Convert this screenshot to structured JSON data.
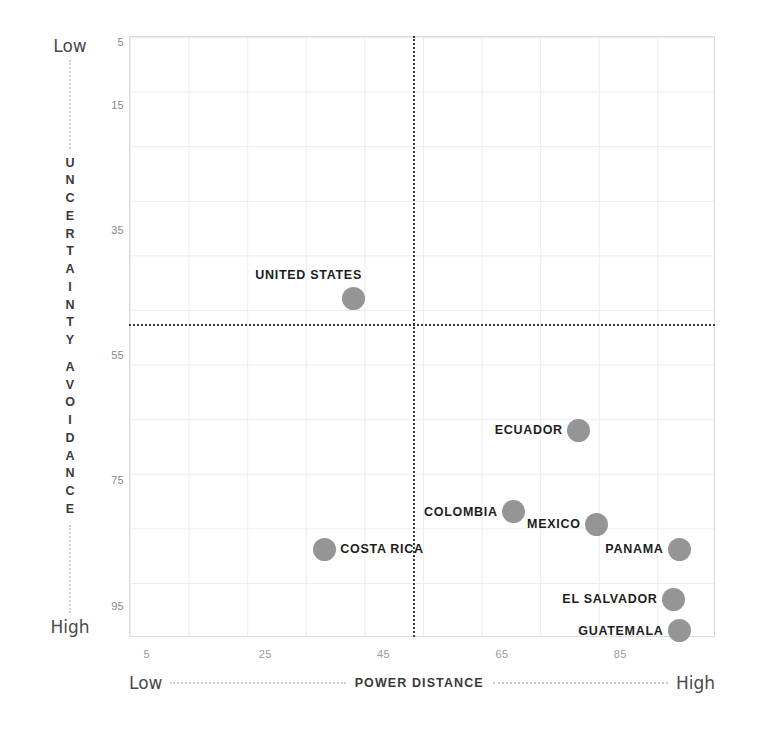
{
  "chart_data": {
    "type": "scatter",
    "title": "",
    "xlabel": "POWER DISTANCE",
    "ylabel": "UNCERTAINTY AVOIDANCE",
    "x_low_label": "Low",
    "x_high_label": "High",
    "y_low_label": "Low",
    "y_high_label": "High",
    "xticks": [
      5,
      25,
      45,
      65,
      85
    ],
    "xtick_labels": [
      "5",
      "25",
      "45",
      "65",
      "85"
    ],
    "yticks": [
      5,
      15,
      35,
      55,
      75,
      95
    ],
    "ytick_labels": [
      "5",
      "15",
      "35",
      "55",
      "75",
      "95"
    ],
    "xlim": [
      2,
      101
    ],
    "ylim": [
      4,
      100
    ],
    "y_inverted": true,
    "grid": true,
    "legend": "none",
    "quadrant_divider_x": 50,
    "quadrant_divider_y": 50,
    "point_color": "#8c8c8c",
    "grid_color": "#ececec",
    "divider_color": "#3b3b3b",
    "points": [
      {
        "name": "UNITED STATES",
        "x": 40,
        "y": 46,
        "label_side": "left"
      },
      {
        "name": "ECUADOR",
        "x": 78,
        "y": 67,
        "label_side": "left"
      },
      {
        "name": "COLOMBIA",
        "x": 67,
        "y": 80,
        "label_side": "left"
      },
      {
        "name": "MEXICO",
        "x": 81,
        "y": 82,
        "label_side": "left"
      },
      {
        "name": "COSTA RICA",
        "x": 35,
        "y": 86,
        "label_side": "right"
      },
      {
        "name": "PANAMA",
        "x": 95,
        "y": 86,
        "label_side": "left"
      },
      {
        "name": "EL SALVADOR",
        "x": 94,
        "y": 94,
        "label_side": "left"
      },
      {
        "name": "GUATEMALA",
        "x": 95,
        "y": 99,
        "label_side": "left"
      }
    ]
  }
}
